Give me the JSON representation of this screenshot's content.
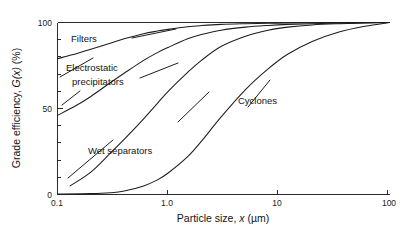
{
  "chart_data": {
    "type": "line",
    "title": "",
    "xlabel": "Particle size, x (µm)",
    "ylabel": "Grade efficiency, G(x) (%)",
    "xscale": "log",
    "yscale": "linear",
    "xlim": [
      0.1,
      100
    ],
    "ylim": [
      0,
      100
    ],
    "grid": false,
    "legend": "inline-labels",
    "xticks": [
      0.1,
      1.0,
      10,
      100
    ],
    "xticklabels": [
      "0.1",
      "1.0",
      "10",
      "100"
    ],
    "yticks": [
      0,
      50,
      100
    ],
    "yticklabels": [
      "0",
      "50",
      "100"
    ],
    "yminorticks": [
      10,
      20,
      30,
      40,
      60,
      70,
      80,
      90
    ],
    "series": [
      {
        "name": "Filters",
        "label": "Filters",
        "x": [
          0.1,
          0.15,
          0.2,
          0.3,
          0.4,
          0.6,
          0.8,
          1.0,
          1.5,
          2.0,
          3.0,
          5.0,
          8.0,
          12.0,
          20.0,
          40.0,
          70.0,
          100.0
        ],
        "y": [
          79,
          82,
          84.5,
          88,
          90.5,
          93.5,
          95,
          96,
          97.5,
          98.2,
          98.9,
          99.3,
          99.55,
          99.7,
          99.8,
          99.9,
          99.95,
          100
        ]
      },
      {
        "name": "Electrostatic precipitators",
        "label": "Electrostatic precipitators",
        "x": [
          0.1,
          0.15,
          0.2,
          0.3,
          0.4,
          0.6,
          0.8,
          1.0,
          1.5,
          2.0,
          3.0,
          5.0,
          8.0,
          12.0,
          20.0,
          40.0,
          70.0,
          100.0
        ],
        "y": [
          46,
          52,
          57,
          65,
          70.5,
          78,
          82.5,
          85.5,
          90.5,
          93,
          95.5,
          97.3,
          98.3,
          98.9,
          99.3,
          99.7,
          99.9,
          100
        ]
      },
      {
        "name": "Wet separators",
        "label": "Wet separators",
        "x": [
          0.13,
          0.2,
          0.3,
          0.4,
          0.6,
          0.8,
          1.0,
          1.5,
          2.0,
          3.0,
          5.0,
          8.0,
          12.0,
          20.0,
          35.0,
          60.0,
          100.0
        ],
        "y": [
          5,
          13,
          24,
          32,
          44,
          53,
          60,
          71,
          78,
          86,
          92,
          95.5,
          97.3,
          98.6,
          99.3,
          99.7,
          100
        ]
      },
      {
        "name": "Cyclones",
        "label": "Cyclones",
        "x": [
          0.1,
          0.2,
          0.3,
          0.4,
          0.6,
          0.8,
          1.0,
          1.5,
          2.0,
          3.0,
          5.0,
          8.0,
          12.0,
          20.0,
          35.0,
          60.0,
          100.0
        ],
        "y": [
          0.3,
          0.5,
          1.0,
          2.0,
          5.0,
          8.5,
          12.5,
          22,
          31,
          45,
          61,
          73,
          81.5,
          89,
          94.5,
          97.8,
          100
        ]
      }
    ],
    "annotations": [
      {
        "text": "Filters",
        "for": "Filters"
      },
      {
        "text": "Electrostatic",
        "for": "Electrostatic precipitators"
      },
      {
        "text": "precipitators",
        "for": "Electrostatic precipitators"
      },
      {
        "text": "Wet separators",
        "for": "Wet separators"
      },
      {
        "text": "Cyclones",
        "for": "Cyclones"
      }
    ]
  },
  "axes": {
    "x": {
      "title_pre": "Particle size, ",
      "title_var": "x",
      "title_post": " (µm)",
      "tick_0": "0.1",
      "tick_1": "1.0",
      "tick_2": "10",
      "tick_3": "100"
    },
    "y": {
      "title_pre": "Grade efficiency, ",
      "title_var": "G(x)",
      "title_post": " (%)",
      "tick_0": "0",
      "tick_50": "50",
      "tick_100": "100"
    }
  },
  "labels": {
    "filters": "Filters",
    "esp_line1": "Electrostatic",
    "esp_line2": "precipitators",
    "wet": "Wet separators",
    "cyclones": "Cyclones"
  },
  "colors": {
    "background": "#ffffff",
    "axis": "#2b2b2b",
    "curve": "#1d1d1d",
    "text": "#141414"
  }
}
